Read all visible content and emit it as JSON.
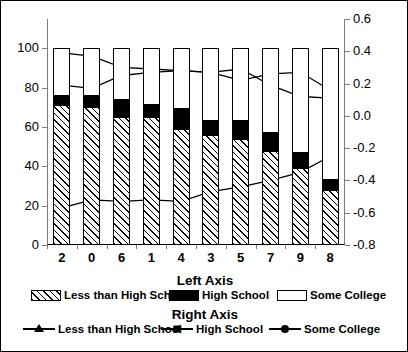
{
  "chart_data": {
    "type": "bar",
    "title": "",
    "subtitle": "",
    "categories": [
      "2",
      "0",
      "6",
      "1",
      "4",
      "3",
      "5",
      "7",
      "9",
      "8"
    ],
    "xlabel": "",
    "left_axis": {
      "label": "Left Axis",
      "ylim": [
        0,
        100
      ],
      "ticks": [
        0,
        20,
        40,
        60,
        80,
        100
      ],
      "tick_labels": [
        "0",
        "20",
        "40",
        "60",
        "80",
        "100"
      ],
      "stacked": true,
      "series": [
        {
          "name": "Less than High School",
          "fill": "hatched",
          "values": [
            71,
            70,
            65,
            65,
            59,
            56,
            54,
            48,
            39,
            28
          ]
        },
        {
          "name": "High School",
          "fill": "solid-black",
          "values": [
            5,
            6,
            9,
            6,
            10,
            7,
            9,
            9,
            8,
            5
          ]
        },
        {
          "name": "Some College",
          "fill": "white",
          "values": [
            24,
            24,
            26,
            29,
            31,
            37,
            37,
            43,
            53,
            67
          ]
        }
      ]
    },
    "right_axis": {
      "label": "Right Axis",
      "ylim": [
        -0.8,
        0.6
      ],
      "ticks": [
        -0.8,
        -0.6,
        -0.4,
        -0.2,
        0.0,
        0.2,
        0.4,
        0.6
      ],
      "tick_labels": [
        "-0.8",
        "-0.6",
        "-0.4",
        "-0.2",
        "0.0",
        "0.2",
        "0.4",
        "0.6"
      ],
      "series": [
        {
          "name": "Less than High School",
          "marker": "triangle",
          "values": [
            -0.57,
            -0.52,
            -0.53,
            -0.52,
            -0.53,
            -0.47,
            -0.44,
            -0.4,
            -0.35,
            -0.25
          ]
        },
        {
          "name": "High School",
          "marker": "square",
          "values": [
            0.39,
            0.37,
            0.3,
            0.29,
            0.28,
            0.27,
            0.29,
            0.19,
            0.12,
            0.11
          ]
        },
        {
          "name": "Some College",
          "marker": "circle",
          "values": [
            0.19,
            0.17,
            0.25,
            0.27,
            0.28,
            0.27,
            0.22,
            0.26,
            0.27,
            0.16
          ]
        }
      ]
    },
    "grid": false,
    "legend_position": "bottom"
  },
  "legend": {
    "left_axis_title": "Left Axis",
    "right_axis_title": "Right Axis",
    "bar_items": [
      {
        "label": "Less than High School",
        "style": "hatched"
      },
      {
        "label": "High School",
        "style": "solid"
      },
      {
        "label": "Some College",
        "style": "white"
      }
    ],
    "line_items": [
      {
        "label": "Less than High School",
        "marker": "triangle"
      },
      {
        "label": "High School",
        "marker": "square"
      },
      {
        "label": "Some College",
        "marker": "circle"
      }
    ]
  },
  "colors": {
    "series_black": "#000000",
    "background": "#ffffff",
    "axis_gray": "#7f7f7f"
  }
}
